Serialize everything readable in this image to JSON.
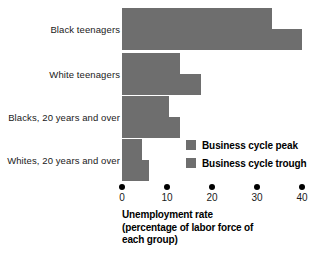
{
  "chart_data": {
    "type": "bar",
    "orientation": "horizontal",
    "title": "",
    "xlabel_lines": [
      "Unemployment rate",
      "(percentage of labor force of",
      "each group)"
    ],
    "ylabel": "",
    "xlim": [
      0,
      40
    ],
    "xticks": [
      0,
      10,
      20,
      30,
      40
    ],
    "xtick_labels": [
      "0",
      "10",
      "20",
      "30",
      "40"
    ],
    "grid": false,
    "legend_position": "inside-right-lower",
    "categories": [
      "Black teenagers",
      "White teenagers",
      "Blacks, 20 years and over",
      "Whites, 20 years and over"
    ],
    "series": [
      {
        "name": "Business cycle peak",
        "color": "#6e6e6e",
        "values": [
          33.3,
          12.9,
          10.4,
          4.5
        ]
      },
      {
        "name": "Business cycle trough",
        "color": "#6e6e6e",
        "values": [
          40.0,
          17.6,
          12.9,
          6.0
        ]
      }
    ]
  },
  "legend": {
    "items": [
      {
        "label": "Business cycle peak",
        "color": "#6e6e6e"
      },
      {
        "label": "Business cycle trough",
        "color": "#6e6e6e"
      }
    ]
  },
  "colors": {
    "bar": "#6e6e6e",
    "text": "#1a1a1a",
    "background": "#ffffff"
  }
}
